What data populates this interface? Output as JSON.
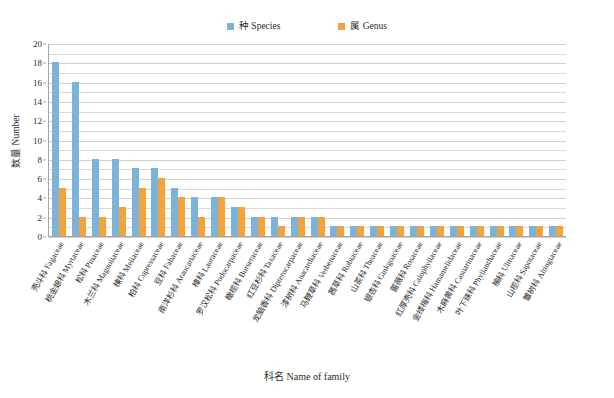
{
  "chart_data": {
    "type": "bar",
    "title": "",
    "xlabel": "科名 Name of family",
    "ylabel": "数量 Number",
    "ylim": [
      0,
      20
    ],
    "ytick_step": 2,
    "gridline_step": 1,
    "grid": true,
    "legend_position": "top-center",
    "categories": [
      "壳斗科 Fagaceae",
      "桃金娘科 Myrtaceae",
      "松科 Pinaceae",
      "木兰科 Magnoliaceae",
      "楝科 Meliaceae",
      "柏科 Cupressaceae",
      "豆科 Fabaceae",
      "南洋杉科 Araucariaceae",
      "樟科 Lauraceae",
      "罗汉松科 Podocarpaceae",
      "橄榄科 Burseraceae",
      "红豆杉科 Taxaceae",
      "龙脑香科 Dipterocarpaceae",
      "漆树科 Anacardiaceae",
      "马鞭草科 Verbenaceae",
      "茜草科 Rubiaceae",
      "山茶科 Theaceae",
      "银杏科 Ginkgoaceae",
      "蔷薇科 Rosaceae",
      "红厚壳科 Calophyllaceae",
      "金缕梅科 Hamamelidaceae",
      "木麻黄科 Casuarinaceae",
      "叶下珠科 Phyllanthaceae",
      "榆科 Ulmaceae",
      "山榄科 Sapotaceae",
      "蕈树科 Altingiaceae"
    ],
    "series": [
      {
        "name": "种 Species",
        "color": "#7cb3d9",
        "values": [
          18,
          16,
          8,
          8,
          7,
          7,
          5,
          4,
          4,
          3,
          2,
          2,
          2,
          2,
          1,
          1,
          1,
          1,
          1,
          1,
          1,
          1,
          1,
          1,
          1,
          1
        ]
      },
      {
        "name": "属 Genus",
        "color": "#f2a33c",
        "values": [
          5,
          2,
          2,
          3,
          5,
          6,
          4,
          2,
          4,
          3,
          2,
          1,
          2,
          2,
          1,
          1,
          1,
          1,
          1,
          1,
          1,
          1,
          1,
          1,
          1,
          1
        ]
      }
    ],
    "yticks": [
      "0",
      "2",
      "4",
      "6",
      "8",
      "10",
      "12",
      "14",
      "16",
      "18",
      "20"
    ]
  },
  "legend": {
    "entries": [
      {
        "label": "种 Species",
        "swatch": "#7cb3d9"
      },
      {
        "label": "属 Genus",
        "swatch": "#f2a33c"
      }
    ]
  }
}
